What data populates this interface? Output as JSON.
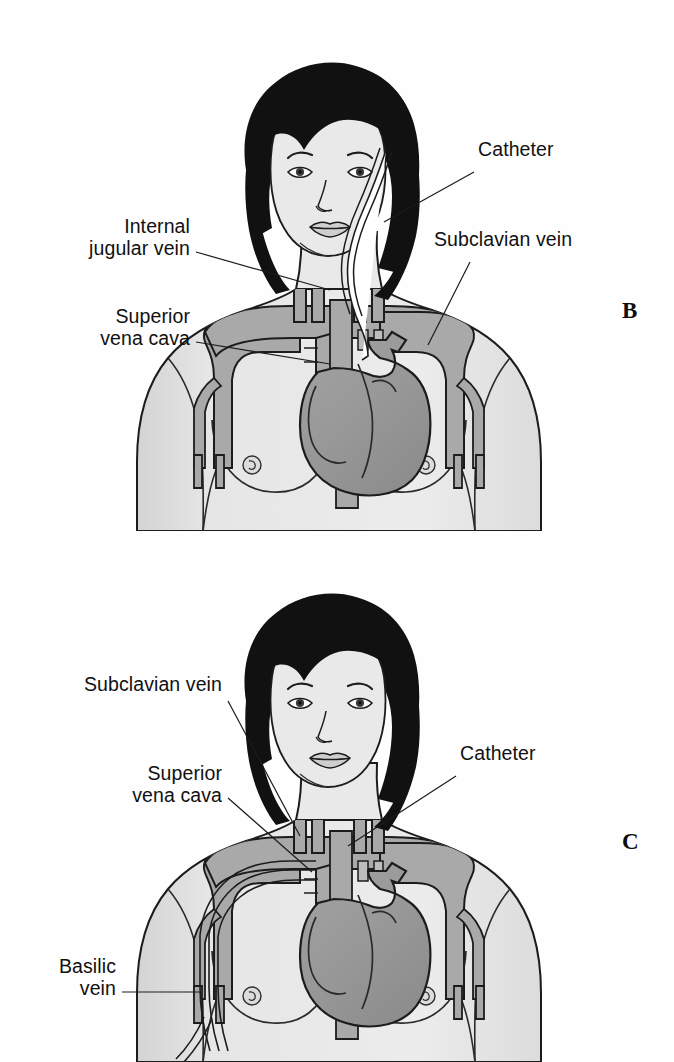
{
  "figure": {
    "background_color": "#fefefe",
    "ink_color": "#111111",
    "skin_color": "#e8e8e8",
    "skin_shadow_color": "#d2d2d2",
    "vessel_color": "#a8a8a8",
    "heart_color": "#9a9a9a",
    "hair_color": "#111111",
    "catheter_color": "#ffffff"
  },
  "panels": [
    {
      "id": "B",
      "letter": "B",
      "letter_x": 622,
      "letter_y": 298,
      "description": "Non-tunneled central venous catheter inserted via the subclavian vein",
      "labels": [
        {
          "name": "internal-jugular-vein",
          "text": "Internal\njugular vein",
          "align": "right",
          "x": 30,
          "y": 215,
          "width": 160,
          "leader": {
            "x1": 196,
            "y1": 252,
            "x2": 330,
            "y2": 290
          }
        },
        {
          "name": "superior-vena-cava",
          "text": "Superior\nvena cava",
          "align": "right",
          "x": 30,
          "y": 305,
          "width": 160,
          "leader": {
            "x1": 196,
            "y1": 342,
            "x2": 330,
            "y2": 364
          }
        },
        {
          "name": "catheter",
          "text": "Catheter",
          "align": "left",
          "x": 478,
          "y": 138,
          "width": 130,
          "leader": {
            "x1": 474,
            "y1": 172,
            "x2": 384,
            "y2": 222
          }
        },
        {
          "name": "subclavian-vein",
          "text": "Subclavian vein",
          "align": "left",
          "x": 434,
          "y": 228,
          "width": 180,
          "leader": {
            "x1": 470,
            "y1": 262,
            "x2": 428,
            "y2": 345
          }
        }
      ]
    },
    {
      "id": "C",
      "letter": "C",
      "letter_x": 622,
      "letter_y": 829,
      "description": "Peripherally inserted central catheter (PICC) threaded from the basilic vein",
      "labels": [
        {
          "name": "subclavian-vein",
          "text": "Subclavian vein",
          "align": "right",
          "x": 26,
          "y": 673,
          "width": 196,
          "leader": {
            "x1": 228,
            "y1": 701,
            "x2": 300,
            "y2": 836
          }
        },
        {
          "name": "superior-vena-cava",
          "text": "Superior\nvena cava",
          "align": "right",
          "x": 46,
          "y": 762,
          "width": 176,
          "leader": {
            "x1": 228,
            "y1": 798,
            "x2": 312,
            "y2": 872
          }
        },
        {
          "name": "catheter",
          "text": "Catheter",
          "align": "left",
          "x": 460,
          "y": 742,
          "width": 130,
          "leader": {
            "x1": 456,
            "y1": 776,
            "x2": 348,
            "y2": 846
          }
        },
        {
          "name": "basilic-vein",
          "text": "Basilic\nvein",
          "align": "right",
          "x": 24,
          "y": 955,
          "width": 92,
          "leader": {
            "x1": 122,
            "y1": 992,
            "x2": 200,
            "y2": 992
          }
        }
      ]
    }
  ]
}
